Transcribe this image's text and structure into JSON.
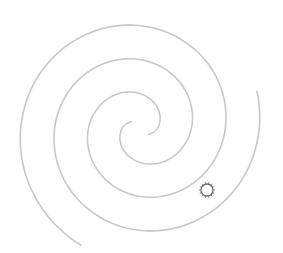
{
  "figure": {
    "background": "#ffffff",
    "line_color": "#c8c8c8",
    "marker_color": "#6a6a6a",
    "spiral": {
      "center": [
        140,
        128
      ],
      "growth_px_per_rad": 10.8,
      "arms": [
        {
          "name": "arm-a",
          "theta_start": 1.0,
          "theta_end": 11.4,
          "phase": 0
        },
        {
          "name": "arm-b",
          "theta_start": 1.0,
          "theta_end": 12.2,
          "phase": 3.14159
        }
      ]
    },
    "marker": {
      "icon": "sun-icon",
      "center": [
        207,
        190
      ],
      "radius": 6,
      "rays": 14
    }
  }
}
